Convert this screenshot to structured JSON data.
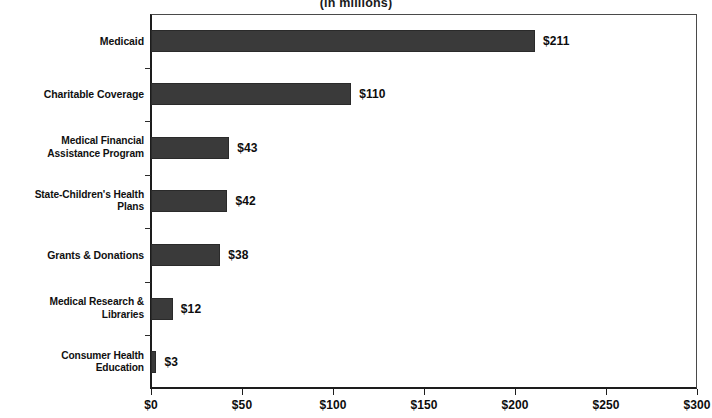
{
  "chart_data": {
    "type": "bar",
    "orientation": "horizontal",
    "title": "",
    "subtitle": "(in millions)",
    "xlabel": "",
    "ylabel": "",
    "xlim": [
      0,
      300
    ],
    "grid": false,
    "legend": null,
    "bar_color": "#3a3a3a",
    "categories": [
      "Medicaid",
      "Charitable Coverage",
      "Medical Financial Assistance Program",
      "State-Children's Health Plans",
      "Grants & Donations",
      "Medical Research & Libraries",
      "Consumer Health Education"
    ],
    "values": [
      211,
      110,
      43,
      42,
      38,
      12,
      3
    ],
    "value_labels": [
      "$211",
      "$110",
      "$43",
      "$42",
      "$38",
      "$12",
      "$3"
    ],
    "xticks": [
      0,
      50,
      100,
      150,
      200,
      250,
      300
    ],
    "xtick_labels": [
      "$0",
      "$50",
      "$100",
      "$150",
      "$200",
      "$250",
      "$300"
    ]
  },
  "category_label_lines": [
    [
      "Medicaid"
    ],
    [
      "Charitable Coverage"
    ],
    [
      "Medical Financial",
      "Assistance Program"
    ],
    [
      "State-Children's Health",
      "Plans"
    ],
    [
      "Grants & Donations"
    ],
    [
      "Medical Research &",
      "Libraries"
    ],
    [
      "Consumer Health",
      "Education"
    ]
  ]
}
